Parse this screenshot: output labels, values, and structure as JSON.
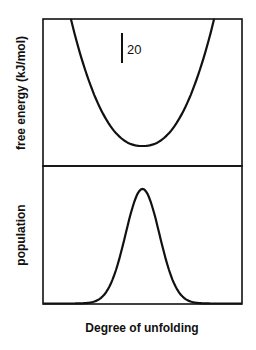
{
  "chart_data": [
    {
      "type": "line",
      "panel": "top",
      "title": "",
      "xlabel": "",
      "ylabel": "free energy (kJ/mol)",
      "grid": false,
      "legend": null,
      "annotations": [
        {
          "type": "scale-bar",
          "label": "20",
          "units": "kJ/mol"
        }
      ],
      "x": [
        0.14,
        0.2,
        0.3,
        0.4,
        0.5,
        0.6,
        0.7,
        0.8,
        0.86
      ],
      "y": [
        98,
        72,
        37,
        13,
        0,
        13,
        37,
        72,
        98
      ],
      "description": "Parabolic free-energy well with minimum at the middle of the unfolding coordinate"
    },
    {
      "type": "line",
      "panel": "bottom",
      "title": "",
      "xlabel": "Degree of unfolding",
      "ylabel": "population",
      "grid": false,
      "legend": null,
      "x": [
        0.0,
        0.29,
        0.35,
        0.4,
        0.45,
        0.5,
        0.55,
        0.6,
        0.65,
        0.71,
        1.0
      ],
      "y": [
        0,
        0,
        0.05,
        0.3,
        0.75,
        1.0,
        0.75,
        0.3,
        0.05,
        0,
        0
      ],
      "description": "Gaussian population distribution centered at middle of unfolding coordinate"
    }
  ],
  "labels": {
    "top_ylabel": "free energy (kJ/mol)",
    "bottom_ylabel": "population",
    "xlabel": "Degree of unfolding",
    "scale_bar": "20"
  },
  "colors": {
    "line": "#111111",
    "background": "#ffffff"
  }
}
